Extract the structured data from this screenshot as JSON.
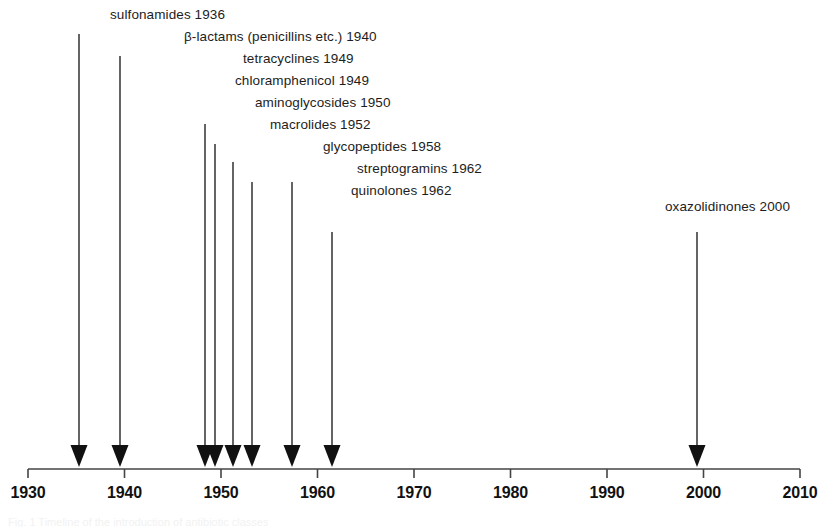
{
  "figure": {
    "ghost_caption": "Fig. 1  Timeline of the introduction of antibiotic classes"
  },
  "colors": {
    "ink": "#1a1a1a",
    "axis": "#444444",
    "background": "#ffffff",
    "arrow": "#111111"
  },
  "axis": {
    "start_year": 1930,
    "end_year": 2010,
    "tick_step": 10,
    "tick_labels": [
      "1930",
      "1940",
      "1950",
      "1960",
      "1970",
      "1980",
      "1990",
      "2000",
      "2010"
    ]
  },
  "events": [
    {
      "id": "sulfonamides",
      "label": "sulfonamides 1936",
      "year": 1936,
      "label_right_px": 225,
      "label_top_px": 8,
      "line_top_px": 34,
      "arrow_x_px": 79
    },
    {
      "id": "beta-lactams",
      "label": "β-lactams (penicillins etc.) 1940",
      "year": 1940,
      "label_right_px": 377,
      "label_top_px": 30,
      "line_top_px": 56,
      "arrow_x_px": 120
    },
    {
      "id": "tetracyclines",
      "label": "tetracyclines 1949",
      "year": 1949,
      "label_right_px": 354,
      "label_top_px": 52,
      "line_top_px": 124,
      "arrow_x_px": 205
    },
    {
      "id": "chloramphenicol",
      "label": "chloramphenicol 1949",
      "year": 1949,
      "label_right_px": 369,
      "label_top_px": 74,
      "line_top_px": 144,
      "arrow_x_px": 215
    },
    {
      "id": "aminoglycosides",
      "label": "aminoglycosides 1950",
      "year": 1950,
      "label_right_px": 391,
      "label_top_px": 96,
      "line_top_px": 162,
      "arrow_x_px": 233
    },
    {
      "id": "macrolides",
      "label": "macrolides 1952",
      "year": 1952,
      "label_right_px": 371,
      "label_top_px": 118,
      "line_top_px": 182,
      "arrow_x_px": 252
    },
    {
      "id": "glycopeptides",
      "label": "glycopeptides 1958",
      "year": 1958,
      "label_right_px": 441,
      "label_top_px": 140,
      "line_top_px": 182,
      "arrow_x_px": 292
    },
    {
      "id": "streptogramins",
      "label": "streptogramins 1962",
      "year": 1962,
      "label_right_px": 482,
      "label_top_px": 162,
      "line_top_px": 232,
      "arrow_x_px": 332
    },
    {
      "id": "quinolones",
      "label": "quinolones 1962",
      "year": 1962,
      "label_right_px": 452,
      "label_top_px": 184,
      "line_top_px": null,
      "arrow_x_px": null
    },
    {
      "id": "oxazolidinones",
      "label": "oxazolidinones 2000",
      "year": 2000,
      "label_right_px": 790,
      "label_top_px": 200,
      "line_top_px": 232,
      "arrow_x_px": 697
    }
  ],
  "chart_data": {
    "type": "timeline",
    "xlabel": "",
    "ylabel": "",
    "xlim": [
      1930,
      2010
    ],
    "grid": false,
    "legend": "none",
    "tick_labels": [
      "1930",
      "1940",
      "1950",
      "1960",
      "1970",
      "1980",
      "1990",
      "2000",
      "2010"
    ],
    "categories": [
      "sulfonamides",
      "β-lactams (penicillins etc.)",
      "tetracyclines",
      "chloramphenicol",
      "aminoglycosides",
      "macrolides",
      "glycopeptides",
      "streptogramins",
      "quinolones",
      "oxazolidinones"
    ],
    "values": [
      1936,
      1940,
      1949,
      1949,
      1950,
      1952,
      1958,
      1962,
      1962,
      2000
    ],
    "annotations": [
      "sulfonamides 1936",
      "β-lactams (penicillins etc.) 1940",
      "tetracyclines 1949",
      "chloramphenicol 1949",
      "aminoglycosides 1950",
      "macrolides 1952",
      "glycopeptides 1958",
      "streptogramins 1962",
      "quinolones 1962",
      "oxazolidinones 2000"
    ]
  }
}
